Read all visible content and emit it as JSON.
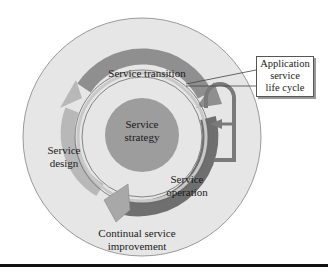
{
  "diagram": {
    "title": "Service life cycle",
    "colors": {
      "outer_disc": "#e6e6e6",
      "outer_border": "#9a9a9a",
      "strategy_core": "#9d9d9d",
      "design_arc": "#b8b8b8",
      "transition_arc": "#8f8f8f",
      "operation_arc": "#6f6f6f",
      "improvement_arrow": "#a8a8a8",
      "text": "#1a1a1a"
    },
    "labels": {
      "strategy_line1": "Service",
      "strategy_line2": "strategy",
      "transition": "Service transition",
      "design_line1": "Service",
      "design_line2": "design",
      "operation_line1": "Service",
      "operation_line2": "operation",
      "improvement_line1": "Continual service",
      "improvement_line2": "improvement"
    },
    "callout": {
      "line1": "Application",
      "line2": "service",
      "line3": "life cycle"
    }
  }
}
